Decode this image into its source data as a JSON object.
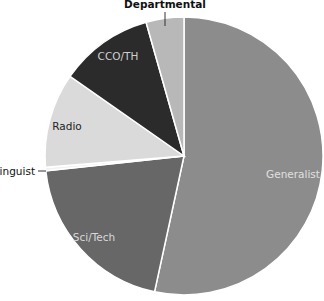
{
  "chart_data": {
    "type": "pie",
    "title": "",
    "start_angle_deg": 0,
    "direction": "clockwise",
    "slices": [
      {
        "label": "Generalist",
        "value": 53.4,
        "color": "#8c8c8c",
        "label_color": "#e0e0e0"
      },
      {
        "label": "Sci/Tech",
        "value": 19.9,
        "color": "#676767",
        "label_color": "#d8d8d8"
      },
      {
        "label": "Linguist",
        "value": 0.4,
        "color": "#f2f2f2",
        "label_color": "#111111"
      },
      {
        "label": "Radio",
        "value": 11.0,
        "color": "#dadada",
        "label_color": "#222222"
      },
      {
        "label": "CCO/TH",
        "value": 10.9,
        "color": "#2b2b2b",
        "label_color": "#cfcfcf"
      },
      {
        "label": "Departmental",
        "value": 4.4,
        "color": "#b8b8b8",
        "label_color": "#111111"
      }
    ],
    "categories": [
      "Generalist",
      "Sci/Tech",
      "Linguist",
      "Radio",
      "CCO/TH",
      "Departmental"
    ],
    "values": [
      53.4,
      19.9,
      0.4,
      11.0,
      10.9,
      4.4
    ],
    "legend": "none (data labels on/next to slices)"
  },
  "labels": {
    "generalist": "Generalist",
    "sci_tech": "Sci/Tech",
    "linguist": "Linguist",
    "radio": "Radio",
    "cco_th": "CCO/TH",
    "departmental": "Departmental"
  }
}
